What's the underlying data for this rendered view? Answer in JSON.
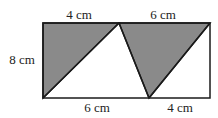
{
  "diagram": {
    "labels": {
      "top_left": "4 cm",
      "top_right": "6 cm",
      "left_side": "8 cm",
      "bottom_left": "6 cm",
      "bottom_right": "4 cm"
    },
    "colors": {
      "shade": "#8a8a8a",
      "stroke": "#1a1a1a",
      "background": "#ffffff"
    }
  }
}
